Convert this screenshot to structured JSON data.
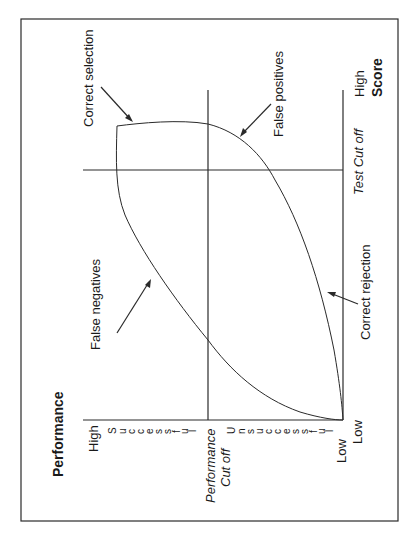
{
  "diagram": {
    "orientation": "rotated-90-ccw",
    "axes": {
      "y_title": "Performance",
      "x_title": "Score",
      "y_high": "High",
      "y_low": "Low",
      "x_high": "High",
      "x_low": "Low",
      "successful_letters": [
        "S",
        "u",
        "c",
        "c",
        "e",
        "s",
        "s",
        "f",
        "u",
        "l"
      ],
      "unsuccessful_letters": [
        "U",
        "n",
        "s",
        "u",
        "c",
        "c",
        "e",
        "s",
        "s",
        "f",
        "u",
        "l"
      ],
      "performance_cutoff_line1": "Performance",
      "performance_cutoff_line2": "Cut off",
      "test_cutoff": "Test Cut off"
    },
    "quadrant_labels": {
      "correct_selection": "Correct selection",
      "false_positives": "False positives",
      "false_negatives": "False negatives",
      "correct_rejection": "Correct rejection"
    },
    "colors": {
      "line": "#2a2a2a",
      "text": "#1a1a1a",
      "background": "#ffffff"
    }
  }
}
